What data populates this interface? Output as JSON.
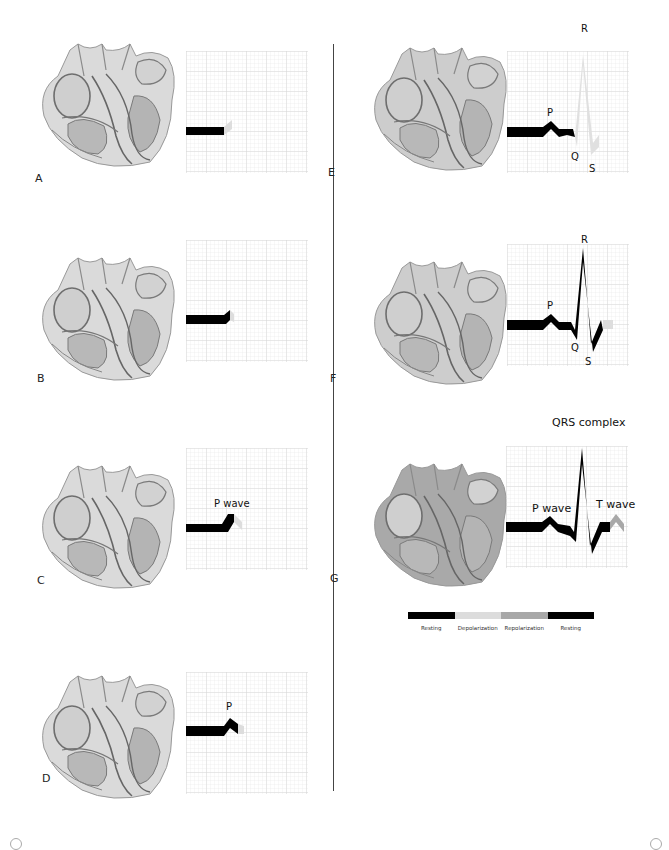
{
  "colors": {
    "resting": "#000000",
    "depolarization": "#dcdcdc",
    "repolarization": "#a8a8a8",
    "grid_minor": "#e6e6e6",
    "grid_major": "#cfcfcf",
    "heart_base": "#d6d6d6",
    "heart_dark": "#8a8a8a"
  },
  "panels": [
    {
      "letter": "A",
      "shade": "light",
      "labels": []
    },
    {
      "letter": "B",
      "shade": "light",
      "labels": []
    },
    {
      "letter": "C",
      "shade": "light",
      "labels": [
        {
          "text": "P wave",
          "kind": "p"
        }
      ]
    },
    {
      "letter": "D",
      "shade": "light",
      "labels": [
        {
          "text": "P",
          "kind": "p"
        }
      ]
    },
    {
      "letter": "E",
      "shade": "mid",
      "labels": [
        {
          "text": "R"
        },
        {
          "text": "P"
        },
        {
          "text": "Q"
        },
        {
          "text": "S"
        }
      ]
    },
    {
      "letter": "F",
      "shade": "mid",
      "labels": [
        {
          "text": "R"
        },
        {
          "text": "P"
        },
        {
          "text": "Q"
        },
        {
          "text": "S"
        }
      ]
    },
    {
      "letter": "G",
      "shade": "dark",
      "labels": [
        {
          "text": "QRS complex"
        },
        {
          "text": "P wave"
        },
        {
          "text": "T wave"
        }
      ]
    }
  ],
  "legend": {
    "items": [
      {
        "label": "Resting",
        "color": "#000000"
      },
      {
        "label": "Depolarization",
        "color": "#dcdcdc"
      },
      {
        "label": "Repolarization",
        "color": "#a8a8a8"
      },
      {
        "label": "Resting",
        "color": "#000000"
      }
    ]
  }
}
